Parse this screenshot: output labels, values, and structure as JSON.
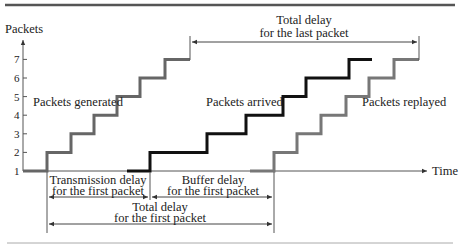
{
  "diagram": {
    "y_axis_label": "Packets",
    "x_axis_label": "Time",
    "y_ticks": [
      "1",
      "2",
      "3",
      "4",
      "5",
      "6",
      "7"
    ],
    "series": [
      {
        "name": "Packets generated",
        "color": "#666666",
        "levels": [
          1,
          2,
          3,
          4,
          5,
          6,
          7
        ]
      },
      {
        "name": "Packets arrived",
        "color": "#111111",
        "levels": [
          1,
          2,
          3,
          4,
          5,
          6,
          7
        ]
      },
      {
        "name": "Packets replayed",
        "color": "#777777",
        "levels": [
          1,
          2,
          3,
          4,
          5,
          6,
          7
        ]
      }
    ],
    "annotations": {
      "total_last_line1": "Total delay",
      "total_last_line2": "for the last packet",
      "transmission_line1": "Transmission delay",
      "transmission_line2": "for the first packet",
      "buffer_line1": "Buffer delay",
      "buffer_line2": "for the first packet",
      "total_first_line1": "Total delay",
      "total_first_line2": "for the first packet"
    }
  }
}
